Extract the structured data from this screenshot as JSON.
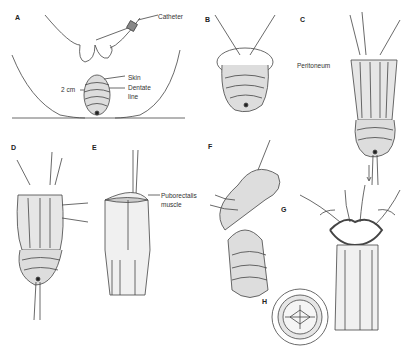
{
  "figure": {
    "panels": [
      {
        "id": "A",
        "label": "A",
        "annotations": [
          "Catheter",
          "Skin",
          "Dentate line",
          "2 cm"
        ]
      },
      {
        "id": "B",
        "label": "B",
        "annotations": []
      },
      {
        "id": "C",
        "label": "C",
        "annotations": [
          "Peritoneum"
        ]
      },
      {
        "id": "D",
        "label": "D",
        "annotations": []
      },
      {
        "id": "E",
        "label": "E",
        "annotations": [
          "Puborectalis muscle"
        ]
      },
      {
        "id": "F",
        "label": "F",
        "annotations": []
      },
      {
        "id": "G",
        "label": "G",
        "annotations": []
      },
      {
        "id": "H",
        "label": "H",
        "annotations": []
      }
    ],
    "text": {
      "catheter": "Catheter",
      "skin": "Skin",
      "dentate_1": "Dentate",
      "dentate_2": "line",
      "two_cm": "2 cm",
      "peritoneum": "Peritoneum",
      "puborectalis_1": "Puborectalis",
      "puborectalis_2": "muscle"
    },
    "colors": {
      "ink": "#333333",
      "shade": "#9a9a9a",
      "background": "#ffffff"
    }
  }
}
